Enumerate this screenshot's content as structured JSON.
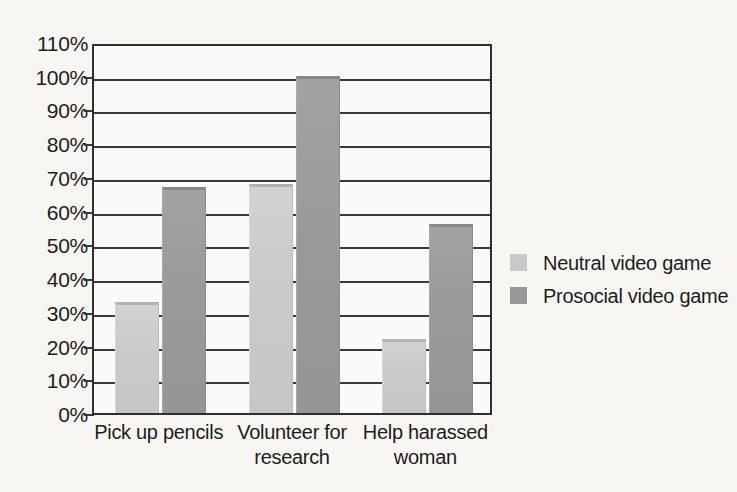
{
  "chart_data": {
    "type": "bar",
    "title": "",
    "xlabel": "",
    "ylabel": "",
    "ylim": [
      0,
      110
    ],
    "ytick_labels": [
      "110%",
      "100%",
      "90%",
      "80%",
      "70%",
      "60%",
      "50%",
      "40%",
      "30%",
      "20%",
      "10%",
      "0%"
    ],
    "ytick_values": [
      110,
      100,
      90,
      80,
      70,
      60,
      50,
      40,
      30,
      20,
      10,
      0
    ],
    "grid": true,
    "legend_position": "right",
    "categories": [
      "Pick up pencils",
      "Volunteer for research",
      "Help harassed woman"
    ],
    "category_lines": [
      [
        "Pick up pencils"
      ],
      [
        "Volunteer for",
        "research"
      ],
      [
        "Help harassed",
        "woman"
      ]
    ],
    "series": [
      {
        "name": "Neutral video game",
        "color": "#c9c9c9",
        "values": [
          33,
          68,
          22
        ]
      },
      {
        "name": "Prosocial video game",
        "color": "#979797",
        "values": [
          67,
          100,
          56
        ]
      }
    ]
  },
  "legend": {
    "items": [
      {
        "label": "Neutral video game",
        "swatch": "neutral"
      },
      {
        "label": "Prosocial video game",
        "swatch": "prosocial"
      }
    ]
  }
}
